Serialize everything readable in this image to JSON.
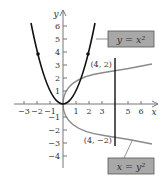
{
  "figure": {
    "axes": {
      "x_label": "x",
      "y_label": "y",
      "x_ticks": [
        {
          "value": -3,
          "label": "−3"
        },
        {
          "value": -2,
          "label": "−2"
        },
        {
          "value": -1,
          "label": "−1"
        },
        {
          "value": 1,
          "label": "1"
        },
        {
          "value": 2,
          "label": "2"
        },
        {
          "value": 3,
          "label": "3"
        },
        {
          "value": 5,
          "label": "5"
        },
        {
          "value": 6,
          "label": "6"
        }
      ],
      "y_ticks": [
        {
          "value": 6,
          "label": "6"
        },
        {
          "value": 5,
          "label": "5"
        },
        {
          "value": 4,
          "label": "4"
        },
        {
          "value": 3,
          "label": "3"
        },
        {
          "value": 2,
          "label": "2"
        },
        {
          "value": 1,
          "label": "1"
        },
        {
          "value": -1,
          "label": "−1"
        },
        {
          "value": -2,
          "label": "−2"
        },
        {
          "value": -3,
          "label": "−3"
        },
        {
          "value": -4,
          "label": "−4"
        }
      ]
    },
    "curves": [
      {
        "name": "parabola-y-equals-x-squared",
        "equation_label": "y = x²",
        "color": "#111111"
      },
      {
        "name": "parabola-x-equals-y-squared",
        "equation_label": "x = y²",
        "color": "#888888"
      }
    ],
    "points": [
      {
        "label": "(4, 2)",
        "x": 4,
        "y": 2
      },
      {
        "label": "(4, −2)",
        "x": 4,
        "y": -2
      }
    ],
    "vertical_line_x": 4,
    "colors": {
      "label_box_fill": "#a8a8a8",
      "label_box_border": "#555555",
      "axis": "#777777"
    }
  }
}
